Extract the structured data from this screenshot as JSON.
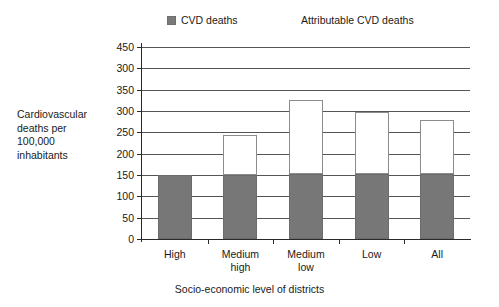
{
  "chart_data": {
    "type": "bar",
    "subtype": "stacked-column",
    "title": "",
    "xlabel": "Socio-economic level of districts",
    "ylabel": "Cardiovascular deaths per 100,000 inhabitants",
    "ylabel_lines": [
      "Cardiovascular",
      "deaths per",
      "100,000",
      "inhabitants"
    ],
    "categories": [
      "High",
      "Medium high",
      "Medium low",
      "Low",
      "All"
    ],
    "category_lines": [
      [
        "High"
      ],
      [
        "Medium",
        "high"
      ],
      [
        "Medium",
        "low"
      ],
      [
        "Low"
      ],
      [
        "All"
      ]
    ],
    "series": [
      {
        "name": "CVD deaths",
        "color": "#777777",
        "values": [
          150,
          150,
          152,
          152,
          153
        ]
      },
      {
        "name": "Attributable CVD deaths",
        "color": "#ffffff",
        "values": [
          0,
          94,
          173,
          146,
          125
        ]
      }
    ],
    "cumulative_tops": [
      150,
      244,
      325,
      298,
      278
    ],
    "ylim": [
      0,
      450
    ],
    "ytick_labels": [
      "450",
      "300",
      "350",
      "300",
      "250",
      "200",
      "150",
      "100",
      "50",
      "0"
    ],
    "ytick_values": [
      450,
      400,
      350,
      300,
      250,
      200,
      150,
      100,
      50,
      0
    ],
    "grid": "horizontal",
    "legend_position": "top"
  },
  "legend": {
    "items": [
      {
        "label": "CVD deaths",
        "marker": "filled-square",
        "color": "#7a7a7a"
      },
      {
        "label": "Attributable CVD deaths",
        "marker": "hollow-square",
        "color": "#ffffff"
      }
    ]
  }
}
